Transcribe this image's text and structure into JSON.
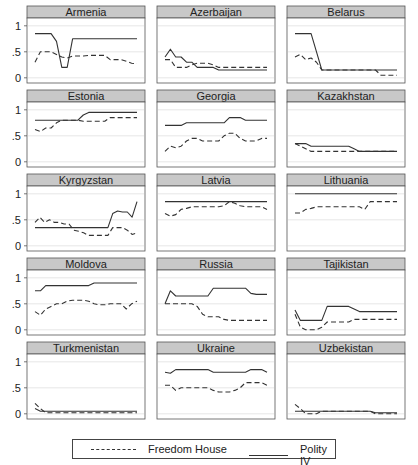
{
  "chart_data": {
    "type": "line",
    "layout": "small multiples 5x3",
    "ylim": [
      -0.1,
      1.15
    ],
    "yticks": [
      0,
      0.5,
      1
    ],
    "ytick_labels": [
      "0",
      ".5",
      "1"
    ],
    "grid": true,
    "legend_position": "bottom",
    "legend": [
      "Freedom House",
      "Polity IV"
    ],
    "x_points": 20,
    "panels": [
      {
        "title": "Armenia",
        "freedom_house": [
          0.3,
          0.5,
          0.5,
          0.5,
          0.45,
          0.4,
          0.38,
          0.42,
          0.42,
          0.42,
          0.43,
          0.43,
          0.43,
          0.43,
          0.35,
          0.35,
          0.35,
          0.32,
          0.28,
          0.27
        ],
        "polity_iv": [
          0.85,
          0.85,
          0.85,
          0.85,
          0.7,
          0.2,
          0.2,
          0.75,
          0.75,
          0.75,
          0.75,
          0.75,
          0.75,
          0.75,
          0.75,
          0.75,
          0.75,
          0.75,
          0.75,
          0.75
        ]
      },
      {
        "title": "Azerbaijan",
        "freedom_house": [
          0.35,
          0.35,
          0.2,
          0.2,
          0.2,
          0.25,
          0.28,
          0.28,
          0.28,
          0.25,
          0.2,
          0.2,
          0.2,
          0.2,
          0.2,
          0.2,
          0.2,
          0.2,
          0.2,
          0.2
        ],
        "polity_iv": [
          0.4,
          0.55,
          0.4,
          0.4,
          0.3,
          0.3,
          0.2,
          0.2,
          0.2,
          0.2,
          0.15,
          0.15,
          0.15,
          0.15,
          0.15,
          0.15,
          0.15,
          0.15,
          0.15,
          0.15
        ]
      },
      {
        "title": "Belarus",
        "freedom_house": [
          0.4,
          0.45,
          0.35,
          0.38,
          0.3,
          0.15,
          0.15,
          0.15,
          0.15,
          0.15,
          0.15,
          0.15,
          0.15,
          0.15,
          0.15,
          0.15,
          0.05,
          0.05,
          0.05,
          0.05
        ],
        "polity_iv": [
          0.85,
          0.85,
          0.85,
          0.85,
          0.5,
          0.15,
          0.15,
          0.15,
          0.15,
          0.15,
          0.15,
          0.15,
          0.15,
          0.15,
          0.15,
          0.15,
          0.15,
          0.15,
          0.15,
          0.15
        ]
      },
      {
        "title": "Estonia",
        "freedom_house": [
          0.62,
          0.58,
          0.65,
          0.65,
          0.75,
          0.8,
          0.8,
          0.8,
          0.8,
          0.78,
          0.78,
          0.78,
          0.78,
          0.78,
          0.85,
          0.85,
          0.85,
          0.85,
          0.85,
          0.85
        ],
        "polity_iv": [
          0.8,
          0.8,
          0.8,
          0.8,
          0.8,
          0.8,
          0.8,
          0.8,
          0.8,
          0.9,
          0.95,
          0.95,
          0.95,
          0.95,
          0.95,
          0.95,
          0.95,
          0.95,
          0.95,
          0.95
        ]
      },
      {
        "title": "Georgia",
        "freedom_house": [
          0.2,
          0.3,
          0.27,
          0.3,
          0.4,
          0.45,
          0.45,
          0.4,
          0.4,
          0.4,
          0.4,
          0.5,
          0.55,
          0.55,
          0.45,
          0.4,
          0.4,
          0.4,
          0.45,
          0.45
        ],
        "polity_iv": [
          0.7,
          0.7,
          0.7,
          0.7,
          0.75,
          0.75,
          0.75,
          0.75,
          0.75,
          0.75,
          0.75,
          0.75,
          0.85,
          0.85,
          0.85,
          0.8,
          0.8,
          0.8,
          0.8,
          0.8
        ]
      },
      {
        "title": "Kazakhstan",
        "freedom_house": [
          0.35,
          0.3,
          0.25,
          0.2,
          0.2,
          0.2,
          0.2,
          0.2,
          0.2,
          0.2,
          0.2,
          0.2,
          0.2,
          0.2,
          0.2,
          0.2,
          0.2,
          0.2,
          0.2,
          0.2
        ],
        "polity_iv": [
          0.35,
          0.35,
          0.35,
          0.3,
          0.3,
          0.3,
          0.3,
          0.3,
          0.3,
          0.3,
          0.3,
          0.25,
          0.2,
          0.2,
          0.2,
          0.2,
          0.2,
          0.2,
          0.2,
          0.2
        ]
      },
      {
        "title": "Kyrgyzstan",
        "freedom_house": [
          0.45,
          0.55,
          0.45,
          0.5,
          0.45,
          0.45,
          0.42,
          0.42,
          0.3,
          0.28,
          0.25,
          0.2,
          0.2,
          0.2,
          0.2,
          0.2,
          0.35,
          0.35,
          0.35,
          0.3,
          0.22,
          0.25
        ],
        "polity_iv": [
          0.35,
          0.35,
          0.35,
          0.35,
          0.35,
          0.35,
          0.35,
          0.35,
          0.35,
          0.35,
          0.35,
          0.35,
          0.35,
          0.35,
          0.35,
          0.35,
          0.62,
          0.67,
          0.65,
          0.65,
          0.55,
          0.85
        ]
      },
      {
        "title": "Latvia",
        "freedom_house": [
          0.62,
          0.57,
          0.6,
          0.7,
          0.72,
          0.75,
          0.75,
          0.75,
          0.75,
          0.75,
          0.75,
          0.77,
          0.85,
          0.82,
          0.77,
          0.75,
          0.75,
          0.75,
          0.75,
          0.7
        ],
        "polity_iv": [
          0.85,
          0.85,
          0.85,
          0.85,
          0.85,
          0.85,
          0.85,
          0.85,
          0.85,
          0.85,
          0.85,
          0.85,
          0.85,
          0.85,
          0.85,
          0.85,
          0.85,
          0.85,
          0.85,
          0.85
        ]
      },
      {
        "title": "Lithuania",
        "freedom_house": [
          0.63,
          0.63,
          0.7,
          0.72,
          0.75,
          0.75,
          0.75,
          0.75,
          0.75,
          0.75,
          0.75,
          0.75,
          0.75,
          0.7,
          0.85,
          0.85,
          0.85,
          0.85,
          0.85,
          0.85
        ],
        "polity_iv": [
          1,
          1,
          1,
          1,
          1,
          1,
          1,
          1,
          1,
          1,
          1,
          1,
          1,
          1,
          1,
          1,
          1,
          1,
          1,
          1
        ]
      },
      {
        "title": "Moldova",
        "freedom_house": [
          0.35,
          0.28,
          0.4,
          0.45,
          0.5,
          0.5,
          0.55,
          0.57,
          0.57,
          0.57,
          0.55,
          0.5,
          0.48,
          0.48,
          0.5,
          0.5,
          0.5,
          0.4,
          0.5,
          0.55
        ],
        "polity_iv": [
          0.75,
          0.75,
          0.85,
          0.85,
          0.85,
          0.85,
          0.85,
          0.85,
          0.85,
          0.85,
          0.85,
          0.9,
          0.9,
          0.9,
          0.9,
          0.9,
          0.9,
          0.9,
          0.9,
          0.9
        ]
      },
      {
        "title": "Russia",
        "freedom_house": [
          0.5,
          0.5,
          0.5,
          0.5,
          0.5,
          0.5,
          0.45,
          0.3,
          0.25,
          0.25,
          0.25,
          0.2,
          0.18,
          0.18,
          0.18,
          0.18,
          0.18,
          0.18,
          0.18,
          0.18
        ],
        "polity_iv": [
          0.5,
          0.75,
          0.65,
          0.65,
          0.65,
          0.65,
          0.65,
          0.65,
          0.65,
          0.8,
          0.8,
          0.8,
          0.8,
          0.8,
          0.8,
          0.8,
          0.7,
          0.68,
          0.68,
          0.68
        ]
      },
      {
        "title": "Tajikistan",
        "freedom_house": [
          0.3,
          0.05,
          0,
          0,
          0,
          0.05,
          0.15,
          0.15,
          0.15,
          0.15,
          0.15,
          0.2,
          0.2,
          0.2,
          0.2,
          0.2,
          0.2,
          0.2,
          0.2,
          0.2
        ],
        "polity_iv": [
          0.38,
          0.18,
          0.18,
          0.18,
          0.18,
          0.18,
          0.45,
          0.45,
          0.45,
          0.45,
          0.45,
          0.4,
          0.35,
          0.35,
          0.35,
          0.35,
          0.35,
          0.35,
          0.35,
          0.35
        ]
      },
      {
        "title": "Turkmenistan",
        "freedom_house": [
          0.2,
          0.1,
          0.02,
          0.02,
          0.02,
          0.02,
          0.02,
          0.02,
          0.02,
          0.02,
          0.02,
          0.02,
          0.02,
          0.02,
          0.02,
          0.02,
          0.02,
          0.02,
          0.02,
          0.02
        ],
        "polity_iv": [
          0.1,
          0.05,
          0.05,
          0.05,
          0.05,
          0.05,
          0.05,
          0.05,
          0.05,
          0.05,
          0.05,
          0.05,
          0.05,
          0.05,
          0.05,
          0.05,
          0.05,
          0.05,
          0.05,
          0.05
        ]
      },
      {
        "title": "Ukraine",
        "freedom_house": [
          0.55,
          0.55,
          0.45,
          0.5,
          0.5,
          0.5,
          0.5,
          0.5,
          0.5,
          0.45,
          0.42,
          0.42,
          0.42,
          0.45,
          0.5,
          0.6,
          0.6,
          0.6,
          0.6,
          0.55
        ],
        "polity_iv": [
          0.8,
          0.78,
          0.85,
          0.85,
          0.85,
          0.85,
          0.85,
          0.85,
          0.85,
          0.8,
          0.8,
          0.8,
          0.8,
          0.8,
          0.8,
          0.8,
          0.85,
          0.85,
          0.85,
          0.8
        ]
      },
      {
        "title": "Uzbekistan",
        "freedom_house": [
          0.18,
          0.1,
          0,
          0,
          0,
          0.05,
          0.05,
          0.05,
          0.05,
          0.05,
          0.05,
          0.05,
          0.05,
          0.05,
          0.05,
          0,
          0,
          0,
          0,
          0
        ],
        "polity_iv": [
          0.05,
          0.05,
          0.05,
          0.05,
          0.05,
          0.05,
          0.05,
          0.05,
          0.05,
          0.05,
          0.05,
          0.05,
          0.05,
          0.05,
          0.05,
          0.02,
          0.02,
          0.02,
          0.02,
          0.02
        ]
      }
    ]
  },
  "legend": {
    "freedom_house_label": "Freedom House",
    "polity_label": "Polity IV"
  },
  "colors": {
    "header_bg": "#c8c8c8",
    "frame": "#555555",
    "grid": "#e0e0e0",
    "line": "#333333"
  }
}
